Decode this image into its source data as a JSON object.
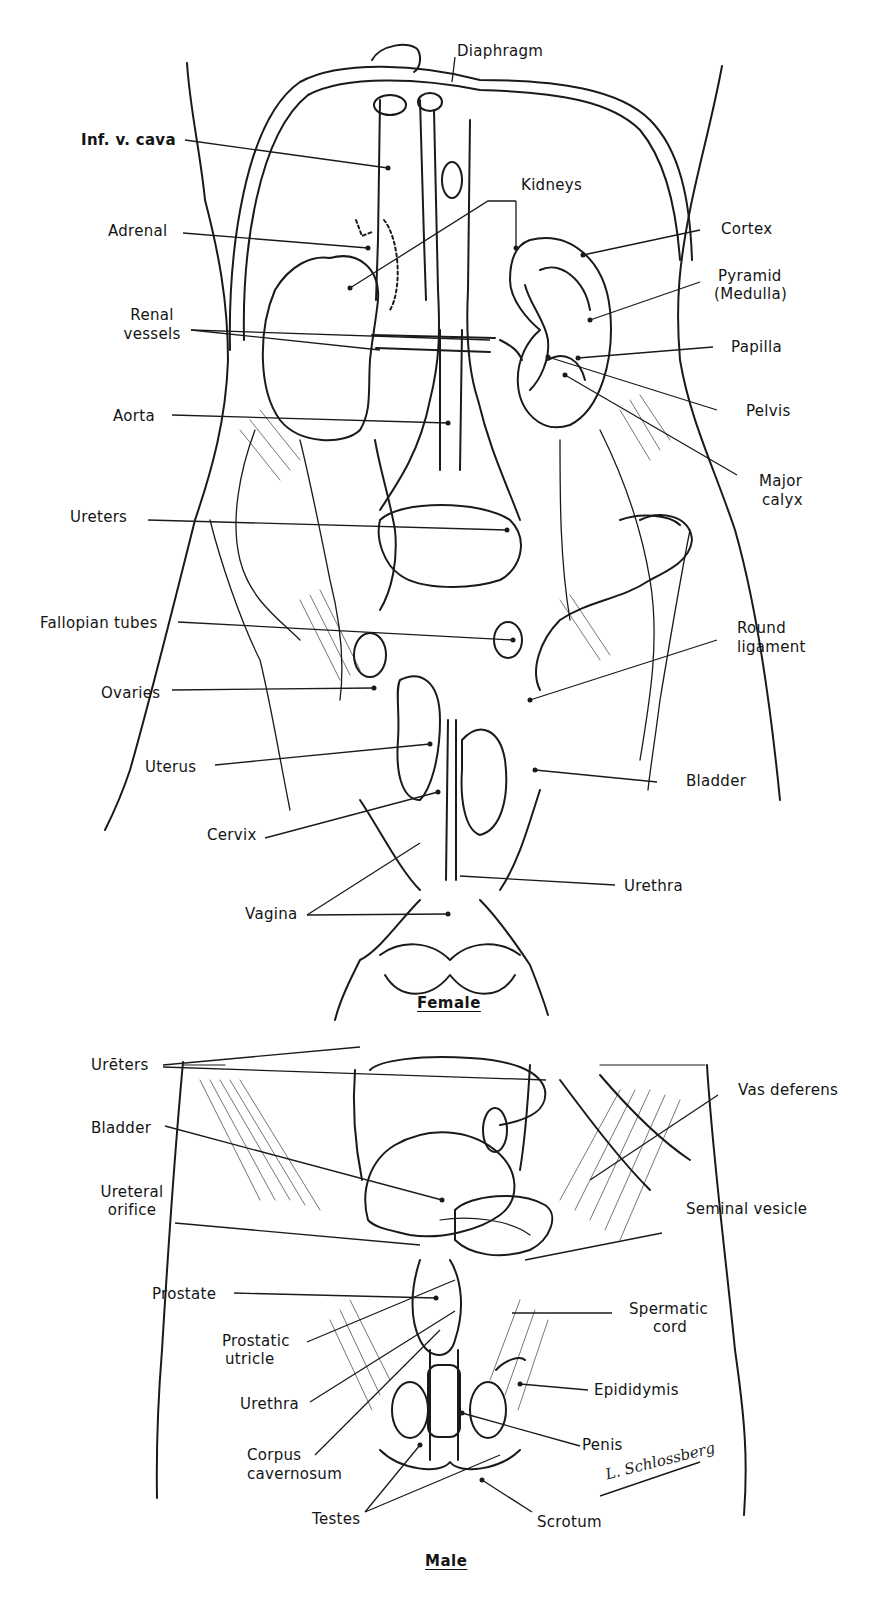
{
  "figure": {
    "sections": [
      {
        "caption": "Female",
        "labels": {
          "diaphragm": "Diaphragm",
          "inf_v_cava": "Inf. v. cava",
          "kidneys": "Kidneys",
          "adrenal": "Adrenal",
          "cortex": "Cortex",
          "pyramid_1": "Pyramid",
          "pyramid_2": "(Medulla)",
          "renal_vessels_1": "Renal",
          "renal_vessels_2": "vessels",
          "papilla": "Papilla",
          "aorta": "Aorta",
          "pelvis": "Pelvis",
          "major_calyx_1": "Major",
          "major_calyx_2": "calyx",
          "ureters": "Ureters",
          "fallopian_tubes": "Fallopian tubes",
          "round_ligament_1": "Round",
          "round_ligament_2": "ligament",
          "ovaries": "Ovaries",
          "uterus": "Uterus",
          "bladder": "Bladder",
          "cervix": "Cervix",
          "urethra": "Urethra",
          "vagina": "Vagina"
        }
      },
      {
        "caption": "Male",
        "labels": {
          "ureters": "Urēters",
          "vas_deferens": "Vas deferens",
          "bladder": "Bladder",
          "ureteral_orifice_1": "Ureteral",
          "ureteral_orifice_2": "orifice",
          "seminal_vesicle": "Seminal vesicle",
          "prostate": "Prostate",
          "spermatic_cord_1": "Spermatic",
          "spermatic_cord_2": "cord",
          "prostatic_utricle_1": "Prostatic",
          "prostatic_utricle_2": "utricle",
          "epididymis": "Epididymis",
          "urethra": "Urethra",
          "penis": "Penis",
          "corpus_cavernosum_1": "Corpus",
          "corpus_cavernosum_2": "cavernosum",
          "testes": "Testes",
          "scrotum": "Scrotum"
        }
      }
    ],
    "signature": "L. Schlossberg"
  }
}
